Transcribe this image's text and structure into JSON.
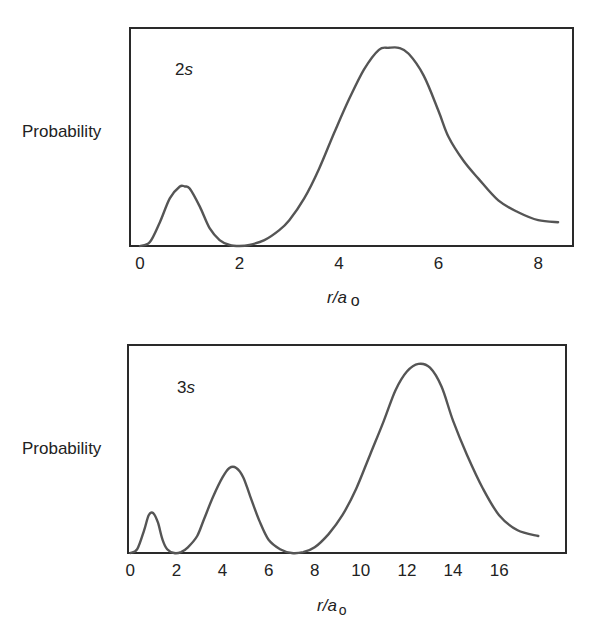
{
  "colors": {
    "curve": "#555555",
    "axes": "#2a2a2a",
    "text": "#222222"
  },
  "chart_data": [
    {
      "type": "line",
      "title": "",
      "orbital_label": {
        "n": "2",
        "l": "s"
      },
      "ylabel": "Probability",
      "xlabel": {
        "var": "r/a",
        "sub": "o"
      },
      "xticks": [
        0,
        2,
        4,
        6,
        8
      ],
      "xlim": [
        -0.2,
        8.7
      ],
      "ylim": [
        0,
        1.1
      ],
      "grid": false,
      "legend": null,
      "series": [
        {
          "name": "2s radial probability",
          "x": [
            0,
            0.2,
            0.4,
            0.6,
            0.8,
            0.9,
            1.0,
            1.2,
            1.4,
            1.6,
            1.8,
            2.0,
            2.2,
            2.5,
            2.8,
            3.0,
            3.3,
            3.6,
            3.9,
            4.2,
            4.5,
            4.8,
            5.0,
            5.2,
            5.4,
            5.7,
            6.0,
            6.2,
            6.5,
            6.8,
            7.2,
            7.6,
            8.0,
            8.4
          ],
          "y": [
            0,
            0.02,
            0.12,
            0.24,
            0.3,
            0.3,
            0.29,
            0.2,
            0.09,
            0.03,
            0.005,
            0.0,
            0.005,
            0.03,
            0.08,
            0.13,
            0.24,
            0.39,
            0.57,
            0.74,
            0.89,
            0.99,
            1.0,
            1.0,
            0.97,
            0.86,
            0.68,
            0.55,
            0.43,
            0.34,
            0.23,
            0.17,
            0.13,
            0.12
          ]
        }
      ],
      "frame": {
        "left": 130,
        "top": 28,
        "right": 573,
        "bottom": 246
      }
    },
    {
      "type": "line",
      "title": "",
      "orbital_label": {
        "n": "3",
        "l": "s"
      },
      "ylabel": "Probability",
      "xlabel": {
        "var": "r/a",
        "sub": "o"
      },
      "xticks": [
        0,
        2,
        4,
        6,
        8,
        10,
        12,
        14,
        16
      ],
      "xlim": [
        -0.1,
        18.9
      ],
      "ylim": [
        0,
        1.1
      ],
      "grid": false,
      "legend": null,
      "series": [
        {
          "name": "3s radial probability",
          "x": [
            0,
            0.3,
            0.6,
            0.8,
            1.0,
            1.2,
            1.4,
            1.6,
            1.9,
            2.2,
            2.5,
            2.9,
            3.2,
            3.6,
            4.0,
            4.3,
            4.6,
            4.9,
            5.2,
            5.6,
            6.0,
            6.5,
            7.0,
            7.5,
            8.0,
            8.6,
            9.2,
            9.8,
            10.4,
            11.0,
            11.5,
            12.0,
            12.5,
            13.0,
            13.5,
            14.0,
            14.6,
            15.3,
            16.0,
            16.8,
            17.7
          ],
          "y": [
            0,
            0.02,
            0.12,
            0.2,
            0.21,
            0.16,
            0.07,
            0.02,
            0.0,
            0.005,
            0.03,
            0.09,
            0.18,
            0.3,
            0.4,
            0.45,
            0.45,
            0.4,
            0.3,
            0.17,
            0.07,
            0.02,
            0.0,
            0.005,
            0.03,
            0.1,
            0.2,
            0.34,
            0.52,
            0.7,
            0.86,
            0.96,
            1.0,
            0.98,
            0.88,
            0.7,
            0.52,
            0.34,
            0.2,
            0.12,
            0.09
          ]
        }
      ],
      "frame": {
        "left": 128,
        "top": 345,
        "right": 566,
        "bottom": 553
      }
    }
  ]
}
